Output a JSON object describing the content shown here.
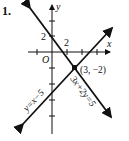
{
  "problem_number": "1.",
  "axes": {
    "x_label": "x",
    "y_label": "y",
    "origin_label": "O",
    "x_tick_label": "2",
    "y_tick_label": "2"
  },
  "lines": [
    {
      "equation": "y = x − 5",
      "label": "y=x−5"
    },
    {
      "equation": "3x + 2y = 5",
      "label": "3x+2y=5"
    }
  ],
  "intersection": {
    "label": "(3, −2)",
    "x": 3,
    "y": -2
  },
  "colors": {
    "ink": "#111111",
    "background": "#ffffff"
  }
}
